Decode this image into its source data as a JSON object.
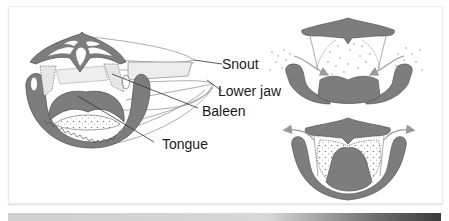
{
  "figure": {
    "labels": {
      "snout": "Snout",
      "lower_jaw": "Lower jaw",
      "baleen": "Baleen",
      "tongue": "Tongue"
    },
    "panels": [
      {
        "name": "head-cross-section-3d",
        "description": "Perspective cross-section of whale head showing snout, lower jaw, baleen and tongue"
      },
      {
        "name": "intake-phase",
        "description": "Water and prey flow into mouth past baleen (arrows inward)"
      },
      {
        "name": "expulsion-phase",
        "description": "Tongue raised, water expelled out through baleen (arrows outward), prey retained"
      }
    ],
    "colors": {
      "tissue": "#7d7d7d",
      "outline": "#555555",
      "baleen_fill": "#dcdcdc",
      "arrow": "#9a9a9a",
      "background": "#ffffff"
    }
  }
}
